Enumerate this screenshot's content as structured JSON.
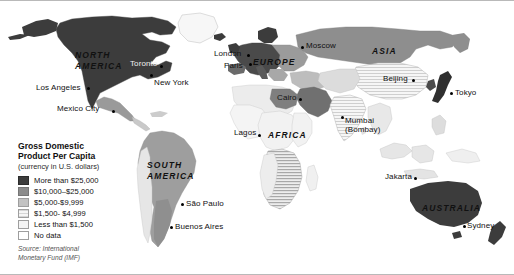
{
  "figure": {
    "kind": "thematic-world-map",
    "background_color": "#ffffff",
    "frame_color": "#b9b9b9"
  },
  "legend": {
    "title_line1": "Gross Domestic",
    "title_line2": "Product Per Capita",
    "subtitle": "(currency in U.S. dollars)",
    "items": [
      {
        "label": "More than $25,000",
        "color": "#3c3c3c",
        "pattern": "solid"
      },
      {
        "label": "$10,000–$25,000",
        "color": "#8c8c8c",
        "pattern": "solid"
      },
      {
        "label": "$5,000-$9,999",
        "color": "#c2c2c2",
        "pattern": "solid"
      },
      {
        "label": "$1,500- $4,999",
        "color": "#e2e2e2",
        "pattern": "hatch"
      },
      {
        "label": "Less than $1,500",
        "color": "#f4f4f4",
        "pattern": "solid"
      },
      {
        "label": "No data",
        "color": "#ffffff",
        "pattern": "solid"
      }
    ],
    "source_line1": "Source: International",
    "source_line2": "Monetary Fund (IMF)"
  },
  "map": {
    "continents": [
      {
        "name": "NORTH AMERICA",
        "line1": "NORTH",
        "line2": "AMERICA",
        "x": 75,
        "y": 50
      },
      {
        "name": "SOUTH AMERICA",
        "line1": "SOUTH",
        "line2": "AMERICA",
        "x": 147,
        "y": 160
      },
      {
        "name": "EUROPE",
        "line1": "EUROPE",
        "line2": "",
        "x": 253,
        "y": 58
      },
      {
        "name": "AFRICA",
        "line1": "AFRICA",
        "line2": "",
        "x": 268,
        "y": 131
      },
      {
        "name": "ASIA",
        "line1": "ASIA",
        "line2": "",
        "x": 372,
        "y": 47
      },
      {
        "name": "AUSTRALIA",
        "line1": "AUSTRALIA",
        "line2": "",
        "x": 422,
        "y": 204
      }
    ],
    "cities": [
      {
        "name": "Los Angeles",
        "label": "Los Angeles",
        "label_x": 36,
        "label_y": 84,
        "dot_x": 87,
        "dot_y": 87,
        "align": "left"
      },
      {
        "name": "Mexico City",
        "label": "Mexico City",
        "label_x": 57,
        "label_y": 105,
        "dot_x": 112,
        "dot_y": 110,
        "align": "left"
      },
      {
        "name": "Toronto",
        "label": "Toronto",
        "label_x": 130,
        "label_y": 63,
        "dot_x": 160,
        "dot_y": 65,
        "align": "left"
      },
      {
        "name": "New York",
        "label": "New York",
        "label_x": 154,
        "label_y": 80,
        "dot_x": 150,
        "dot_y": 74,
        "align": "left"
      },
      {
        "name": "Sao Paulo",
        "label": "São Paulo",
        "label_x": 186,
        "label_y": 205,
        "dot_x": 181,
        "dot_y": 203,
        "align": "left"
      },
      {
        "name": "Buenos Aires",
        "label": "Buenos Aires",
        "label_x": 175,
        "label_y": 228,
        "dot_x": 170,
        "dot_y": 226,
        "align": "left"
      },
      {
        "name": "London",
        "label": "London",
        "label_x": 218,
        "label_y": 51,
        "dot_x": 247,
        "dot_y": 54,
        "align": "left"
      },
      {
        "name": "Paris",
        "label": "Paris",
        "label_x": 228,
        "label_y": 63,
        "dot_x": 249,
        "dot_y": 63,
        "align": "left"
      },
      {
        "name": "Moscow",
        "label": "Moscow",
        "label_x": 306,
        "label_y": 45,
        "dot_x": 301,
        "dot_y": 46,
        "align": "left"
      },
      {
        "name": "Cairo",
        "label": "Cairo",
        "label_x": 277,
        "label_y": 97,
        "dot_x": 299,
        "dot_y": 98,
        "align": "left"
      },
      {
        "name": "Lagos",
        "label": "Lagos",
        "label_x": 236,
        "label_y": 131,
        "dot_x": 258,
        "dot_y": 134,
        "align": "left"
      },
      {
        "name": "Beijing",
        "label": "Beijing",
        "label_x": 385,
        "label_y": 79,
        "dot_x": 412,
        "dot_y": 79,
        "align": "left"
      },
      {
        "name": "Tokyo",
        "label": "Tokyo",
        "label_x": 455,
        "label_y": 92,
        "dot_x": 450,
        "dot_y": 92,
        "align": "left"
      },
      {
        "name": "Jakarta",
        "label": "Jakarta",
        "label_x": 387,
        "label_y": 176,
        "dot_x": 414,
        "dot_y": 177,
        "align": "left"
      },
      {
        "name": "Sydney",
        "label": "Sydney",
        "label_x": 467,
        "label_y": 226,
        "dot_x": 463,
        "dot_y": 225,
        "align": "left"
      }
    ],
    "cities_two_line": [
      {
        "name": "Mumbai",
        "line1": "Mumbai",
        "line2": "(Bombay)",
        "label_x": 345,
        "label_y": 119,
        "dot_x": 341,
        "dot_y": 116
      }
    ],
    "colors": {
      "tier1_over_25k": "#3c3c3c",
      "tier2_10k_25k": "#8c8c8c",
      "tier3_5k_10k": "#c2c2c2",
      "tier4_1500_5k": "#dedede",
      "tier5_under_1500": "#f2f2f2",
      "no_data": "#ffffff",
      "outline": "#9a9a9a"
    }
  }
}
